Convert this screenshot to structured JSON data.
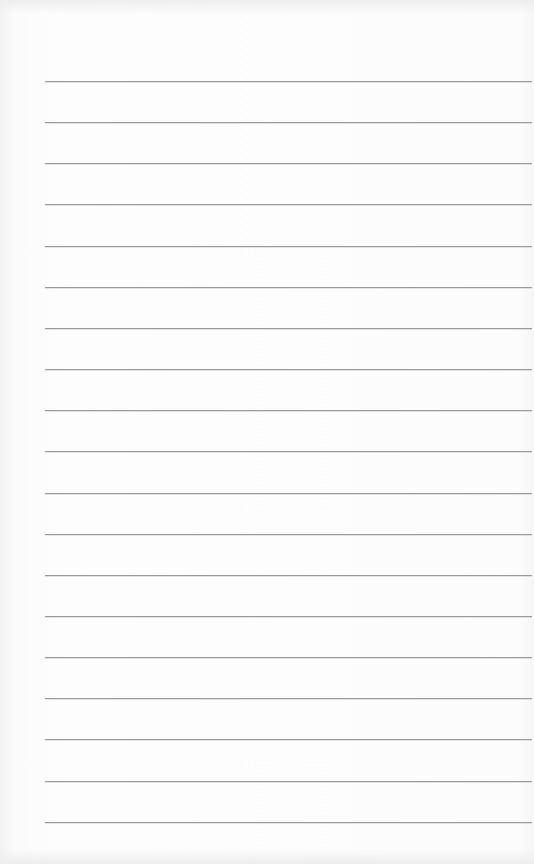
{
  "page": {
    "type": "lined-paper",
    "background_color": "#fafafa",
    "line_color": "#9a9a9a",
    "line_count": 19,
    "first_line_y": 81,
    "line_spacing": 41.15,
    "line_left": 45,
    "line_right": 532
  }
}
